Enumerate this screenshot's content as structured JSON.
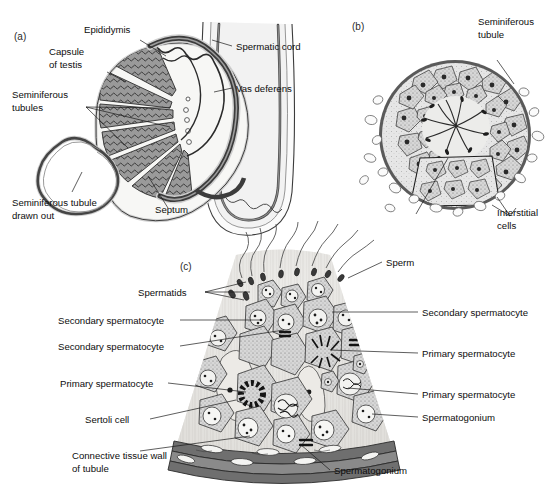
{
  "figure": {
    "background": "#ffffff",
    "ink": "#1a1a1a",
    "panels": [
      {
        "id": "a",
        "label": "(a)",
        "caption_subject": "sagittal section of testis, epididymis and spermatic cord"
      },
      {
        "id": "b",
        "label": "(b)",
        "caption_subject": "cross-section of a seminiferous tubule"
      },
      {
        "id": "c",
        "label": "(c)",
        "caption_subject": "enlarged wedge of seminiferous tubule wall showing spermatogenesis"
      }
    ]
  },
  "panel_a": {
    "label": "(a)",
    "labels": {
      "epididymis": "Epididymis",
      "capsule_of_testis": "Capsule\nof testis",
      "capsule_line1": "Capsule",
      "capsule_line2": "of testis",
      "seminiferous_tubules_line1": "Seminiferous",
      "seminiferous_tubules_line2": "tubules",
      "seminiferous_tubule_drawn_out_line1": "Seminiferous tubule",
      "seminiferous_tubule_drawn_out_line2": "drawn out",
      "septum": "Septum",
      "spermatic_cord": "Spermatic cord",
      "vas_deferens": "Vas deferens"
    }
  },
  "panel_b": {
    "label": "(b)",
    "labels": {
      "seminiferous_tubule_line1": "Seminiferous",
      "seminiferous_tubule_line2": "tubule",
      "interstitial_cells_line1": "Interstitial",
      "interstitial_cells_line2": "cells"
    }
  },
  "panel_c": {
    "label": "(c)",
    "labels_left": {
      "spermatids": "Spermatids",
      "secondary_spermatocyte_1": "Secondary spermatocyte",
      "secondary_spermatocyte_2": "Secondary spermatocyte",
      "primary_spermatocyte_1": "Primary spermatocyte",
      "sertoli_cell": "Sertoli  cell",
      "connective_tissue_wall_line1": "Connective tissue wall",
      "connective_tissue_wall_line2": "of tubule"
    },
    "labels_right": {
      "sperm": "Sperm",
      "secondary_spermatocyte": "Secondary spermatocyte",
      "primary_spermatocyte_1": "Primary spermatocyte",
      "primary_spermatocyte_2": "Primary spermatocyte",
      "spermatogonium_right": "Spermatogonium",
      "spermatogonium_bottom": "Spermatogonium"
    }
  }
}
